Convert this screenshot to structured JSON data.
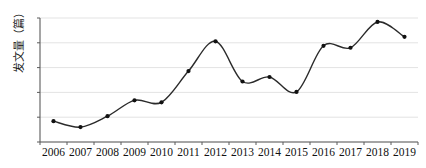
{
  "chart_data": {
    "type": "line",
    "title": "",
    "subtitle": "",
    "xlabel": "",
    "ylabel": "发文量（篇）",
    "categories": [
      "2006",
      "2007",
      "2008",
      "2009",
      "2010",
      "2011",
      "2012",
      "2013",
      "2014",
      "2015",
      "2016",
      "2017",
      "2018",
      "2019"
    ],
    "x": [
      2006,
      2007,
      2008,
      2009,
      2010,
      2011,
      2012,
      2013,
      2014,
      2015,
      2016,
      2017,
      2018,
      2019
    ],
    "values": [
      4.2,
      3.0,
      5.2,
      8.4,
      8.0,
      14.3,
      20.3,
      12.2,
      13.1,
      10.1,
      19.4,
      19.0,
      24.2,
      21.2
    ],
    "series": [
      {
        "name": "发文量",
        "values": [
          4.2,
          3.0,
          5.2,
          8.4,
          8.0,
          14.3,
          20.3,
          12.2,
          13.1,
          10.1,
          19.4,
          19.0,
          24.2,
          21.2
        ]
      }
    ],
    "ylim": [
      0,
      25
    ],
    "yticks": [
      0,
      5,
      10,
      15,
      20,
      25
    ],
    "ytick_labels": [
      "0",
      "5",
      "10",
      "15",
      "20",
      "25"
    ],
    "xtick_labels": [
      "2006",
      "2007",
      "2008",
      "2009",
      "2010",
      "2011",
      "2012",
      "2013",
      "2014",
      "2015",
      "2016",
      "2017",
      "2018",
      "2019"
    ],
    "grid": true,
    "grid_axis": "y",
    "legend": false,
    "legend_position": "none",
    "smooth": true,
    "marker": "circle",
    "colors": {
      "line": "#2b2b2b",
      "marker": "#111111",
      "grid": "#e3e3e3",
      "axis": "#5a5a5a",
      "text": "#111111",
      "background": "#ffffff"
    },
    "annotations": []
  }
}
